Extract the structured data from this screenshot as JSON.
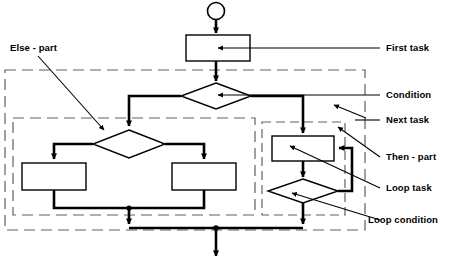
{
  "diagram": {
    "type": "uml-activity-flowchart",
    "title": "",
    "colors": {
      "stroke": "#000000",
      "node_fill": "#ffffff",
      "region_border": "#555555",
      "text": "#000000"
    },
    "nodes": [
      {
        "id": "start",
        "kind": "initial-node",
        "label": "",
        "shape": "circle"
      },
      {
        "id": "first-task",
        "kind": "action",
        "label": "",
        "shape": "rectangle"
      },
      {
        "id": "condition",
        "kind": "decision",
        "label": "",
        "shape": "diamond"
      },
      {
        "id": "next-task",
        "kind": "decision",
        "label": "",
        "shape": "diamond"
      },
      {
        "id": "else-task-left",
        "kind": "action",
        "label": "",
        "shape": "rectangle"
      },
      {
        "id": "else-task-right",
        "kind": "action",
        "label": "",
        "shape": "rectangle"
      },
      {
        "id": "loop-task",
        "kind": "action",
        "label": "",
        "shape": "rectangle"
      },
      {
        "id": "loop-condition",
        "kind": "decision",
        "label": "",
        "shape": "diamond"
      },
      {
        "id": "end",
        "kind": "final-arrow",
        "label": "",
        "shape": "arrow"
      }
    ],
    "regions": [
      {
        "id": "outer-region",
        "label": "",
        "style": "dashed"
      },
      {
        "id": "else-part-region",
        "label": "",
        "style": "dashed"
      },
      {
        "id": "then-part-region",
        "label": "",
        "style": "dashed"
      }
    ]
  },
  "callouts": {
    "else_part": "Else - part",
    "first_task": "First task",
    "condition": "Condition",
    "next_task": "Next task",
    "then_part": "Then - part",
    "loop_task": "Loop task",
    "loop_condition": "Loop condition"
  }
}
